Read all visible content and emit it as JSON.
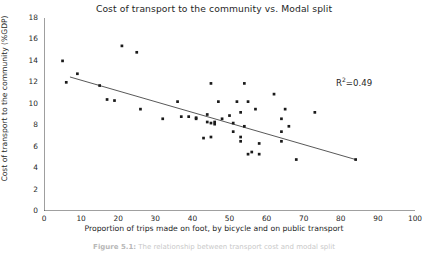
{
  "chart": {
    "title": "Cost of transport to the community vs. Modal split",
    "xlabel": "Proportion of trips made on foot, by bicycle and on public transport",
    "ylabel": "Cost of transport to the community (%GDP)",
    "annotation_prefix": "R",
    "annotation_sup": "2",
    "annotation_value": "=0.49"
  },
  "caption": {
    "label": "Figure 5.1:",
    "text": "The relationship between transport cost and modal split"
  },
  "chart_data": {
    "type": "scatter",
    "title": "Cost of transport to the community vs. Modal split",
    "xlabel": "Proportion of trips made on foot, by bicycle and on public transport",
    "ylabel": "Cost of transport to the community (%GDP)",
    "xlim": [
      0,
      100
    ],
    "ylim": [
      0,
      18
    ],
    "xticks": [
      0,
      10,
      20,
      30,
      40,
      50,
      60,
      70,
      80,
      90,
      100
    ],
    "yticks": [
      0,
      2,
      4,
      6,
      8,
      10,
      12,
      14,
      16,
      18
    ],
    "grid": false,
    "legend": null,
    "r_squared": 0.49,
    "annotation": "R2=0.49",
    "trendline": {
      "type": "linear",
      "x_start": 7,
      "y_start": 12.5,
      "x_end": 84,
      "y_end": 4.8
    },
    "points": [
      {
        "x": 5,
        "y": 14.0
      },
      {
        "x": 6,
        "y": 12.0
      },
      {
        "x": 9,
        "y": 12.8
      },
      {
        "x": 15,
        "y": 11.7
      },
      {
        "x": 17,
        "y": 10.4
      },
      {
        "x": 19,
        "y": 10.3
      },
      {
        "x": 21,
        "y": 15.4
      },
      {
        "x": 25,
        "y": 14.8
      },
      {
        "x": 26,
        "y": 9.5
      },
      {
        "x": 32,
        "y": 8.6
      },
      {
        "x": 36,
        "y": 10.2
      },
      {
        "x": 37,
        "y": 8.8
      },
      {
        "x": 39,
        "y": 8.8
      },
      {
        "x": 41,
        "y": 8.6
      },
      {
        "x": 41,
        "y": 8.7
      },
      {
        "x": 43,
        "y": 6.8
      },
      {
        "x": 44,
        "y": 9.0
      },
      {
        "x": 44,
        "y": 8.3
      },
      {
        "x": 45,
        "y": 6.9
      },
      {
        "x": 45,
        "y": 11.9
      },
      {
        "x": 45,
        "y": 8.2
      },
      {
        "x": 46,
        "y": 8.3
      },
      {
        "x": 46,
        "y": 8.1
      },
      {
        "x": 47,
        "y": 10.2
      },
      {
        "x": 48,
        "y": 8.6
      },
      {
        "x": 50,
        "y": 8.9
      },
      {
        "x": 51,
        "y": 7.4
      },
      {
        "x": 51,
        "y": 8.2
      },
      {
        "x": 52,
        "y": 10.2
      },
      {
        "x": 53,
        "y": 6.9
      },
      {
        "x": 53,
        "y": 9.2
      },
      {
        "x": 53,
        "y": 6.5
      },
      {
        "x": 54,
        "y": 7.9
      },
      {
        "x": 54,
        "y": 11.9
      },
      {
        "x": 55,
        "y": 5.3
      },
      {
        "x": 55,
        "y": 10.2
      },
      {
        "x": 56,
        "y": 5.5
      },
      {
        "x": 57,
        "y": 9.5
      },
      {
        "x": 58,
        "y": 5.3
      },
      {
        "x": 58,
        "y": 6.3
      },
      {
        "x": 62,
        "y": 10.9
      },
      {
        "x": 64,
        "y": 8.6
      },
      {
        "x": 64,
        "y": 7.4
      },
      {
        "x": 64,
        "y": 6.5
      },
      {
        "x": 65,
        "y": 9.5
      },
      {
        "x": 66,
        "y": 7.9
      },
      {
        "x": 68,
        "y": 4.8
      },
      {
        "x": 73,
        "y": 9.2
      },
      {
        "x": 84,
        "y": 4.8
      }
    ]
  }
}
